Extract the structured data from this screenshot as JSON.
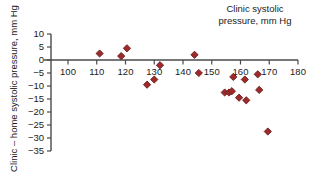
{
  "chart_data": {
    "type": "scatter",
    "title": "Clinic systolic\npressure, mm Hg",
    "xlabel": "Clinic systolic pressure, mm Hg",
    "ylabel": "Clinic – home systolic pressure, mm Hg",
    "xlim": [
      93,
      180
    ],
    "ylim": [
      -36,
      10
    ],
    "xticks": [
      100,
      110,
      120,
      130,
      140,
      150,
      160,
      170,
      180
    ],
    "yticks": [
      10,
      5,
      0,
      -5,
      -10,
      -15,
      -20,
      -25,
      -30,
      -35
    ],
    "xticklabels": [
      "100",
      "110",
      "120",
      "130",
      "140",
      "150",
      "160",
      "170",
      "180"
    ],
    "yticklabels": [
      "10",
      "5",
      "0",
      "−5",
      "−10",
      "−15",
      "−20",
      "−25",
      "−30",
      "−35"
    ],
    "grid": false,
    "legend": null,
    "marker": "diamond",
    "marker_color": "#9e2a2b",
    "marker_edge_color": "#6b1a1a",
    "zero_line": 0,
    "series": [
      {
        "name": "Clinic minus home systolic pressure",
        "points": [
          {
            "x": 111.0,
            "y": 2.5
          },
          {
            "x": 118.5,
            "y": 1.5
          },
          {
            "x": 120.5,
            "y": 4.5
          },
          {
            "x": 127.5,
            "y": -9.5
          },
          {
            "x": 130.0,
            "y": -7.5
          },
          {
            "x": 132.0,
            "y": -2.0
          },
          {
            "x": 144.0,
            "y": 2.0
          },
          {
            "x": 145.5,
            "y": -5.0
          },
          {
            "x": 154.5,
            "y": -12.5
          },
          {
            "x": 156.0,
            "y": -12.5
          },
          {
            "x": 157.0,
            "y": -12.0
          },
          {
            "x": 157.5,
            "y": -6.5
          },
          {
            "x": 159.5,
            "y": -14.5
          },
          {
            "x": 161.5,
            "y": -7.5
          },
          {
            "x": 162.0,
            "y": -15.5
          },
          {
            "x": 166.0,
            "y": -5.5
          },
          {
            "x": 166.5,
            "y": -11.5
          },
          {
            "x": 169.5,
            "y": -27.5
          }
        ]
      }
    ]
  }
}
